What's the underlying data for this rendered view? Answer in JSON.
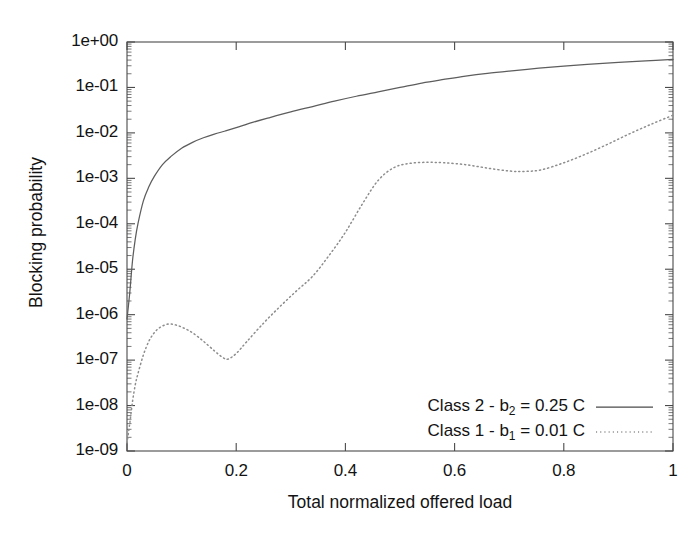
{
  "chart_data": {
    "type": "line",
    "title": "",
    "xlabel": "Total normalized offered load",
    "ylabel": "Blocking probability",
    "xlim": [
      0,
      1
    ],
    "ylim": [
      1e-09,
      1
    ],
    "yscale": "log",
    "xscale": "linear",
    "grid": false,
    "legend_position": "lower right",
    "xticks": [
      "0",
      "0.2",
      "0.4",
      "0.6",
      "0.8",
      "1"
    ],
    "xtick_values": [
      0,
      0.2,
      0.4,
      0.6,
      0.8,
      1
    ],
    "yticks": [
      "1e+00",
      "1e-01",
      "1e-02",
      "1e-03",
      "1e-04",
      "1e-05",
      "1e-06",
      "1e-07",
      "1e-08",
      "1e-09"
    ],
    "ytick_values": [
      1,
      0.1,
      0.01,
      0.001,
      0.0001,
      1e-05,
      1e-06,
      1e-07,
      1e-08,
      1e-09
    ],
    "series": [
      {
        "name": "Class 2 - b2 = 0.25 C",
        "legend_prefix": "Class 2 - b",
        "legend_sub": "2",
        "legend_suffix": " = 0.25 C",
        "style": "solid",
        "color": "#5d5d5d",
        "x": [
          0.0,
          0.005,
          0.01,
          0.015,
          0.02,
          0.03,
          0.04,
          0.05,
          0.065,
          0.08,
          0.1,
          0.12,
          0.14,
          0.16,
          0.18,
          0.2,
          0.23,
          0.26,
          0.3,
          0.34,
          0.38,
          0.42,
          0.46,
          0.5,
          0.54,
          0.58,
          0.62,
          0.66,
          0.7,
          0.75,
          0.8,
          0.85,
          0.9,
          0.95,
          1.0
        ],
        "y": [
          8e-07,
          3e-06,
          1.5e-05,
          4.5e-05,
          0.0001,
          0.00032,
          0.00065,
          0.0011,
          0.002,
          0.003,
          0.0046,
          0.0062,
          0.0078,
          0.0094,
          0.011,
          0.013,
          0.017,
          0.0215,
          0.029,
          0.038,
          0.05,
          0.064,
          0.08,
          0.1,
          0.125,
          0.15,
          0.178,
          0.205,
          0.23,
          0.262,
          0.295,
          0.325,
          0.355,
          0.385,
          0.415
        ]
      },
      {
        "name": "Class 1 - b1 = 0.01 C",
        "legend_prefix": "Class 1 - b",
        "legend_sub": "1",
        "legend_suffix": " = 0.01 C",
        "style": "dotted",
        "color": "#8d8d8d",
        "x": [
          0.0,
          0.005,
          0.01,
          0.015,
          0.02,
          0.03,
          0.04,
          0.05,
          0.06,
          0.075,
          0.09,
          0.105,
          0.12,
          0.14,
          0.16,
          0.175,
          0.185,
          0.2,
          0.22,
          0.25,
          0.28,
          0.31,
          0.34,
          0.37,
          0.4,
          0.43,
          0.46,
          0.49,
          0.52,
          0.55,
          0.58,
          0.62,
          0.66,
          0.7,
          0.73,
          0.76,
          0.8,
          0.84,
          0.88,
          0.92,
          0.96,
          1.0
        ],
        "y": [
          1.5e-09,
          4e-09,
          1.2e-08,
          2.8e-08,
          5e-08,
          1.3e-07,
          2.6e-07,
          4e-07,
          5.2e-07,
          6.2e-07,
          5.9e-07,
          5e-07,
          4e-07,
          2.6e-07,
          1.6e-07,
          1.15e-07,
          1.05e-07,
          1.4e-07,
          2.6e-07,
          6.5e-07,
          1.5e-06,
          3.3e-06,
          7e-06,
          2e-05,
          6.5e-05,
          0.00026,
          0.0009,
          0.00175,
          0.00215,
          0.00225,
          0.0022,
          0.002,
          0.00168,
          0.00145,
          0.00142,
          0.00155,
          0.0022,
          0.0034,
          0.0056,
          0.0095,
          0.0155,
          0.0245
        ]
      }
    ]
  },
  "axes": {
    "y_title": "Blocking probability",
    "x_title": "Total normalized offered load",
    "y_tick_labels": [
      "1e+00",
      "1e-01",
      "1e-02",
      "1e-03",
      "1e-04",
      "1e-05",
      "1e-06",
      "1e-07",
      "1e-08",
      "1e-09"
    ],
    "x_tick_labels": [
      "0",
      "0.2",
      "0.4",
      "0.6",
      "0.8",
      "1"
    ]
  },
  "legend": {
    "entries": [
      {
        "prefix": "Class 2 - b",
        "sub": "2",
        "suffix": " = 0.25 C",
        "style": "solid"
      },
      {
        "prefix": "Class 1 - b",
        "sub": "1",
        "suffix": " = 0.01 C",
        "style": "dotted"
      }
    ]
  }
}
